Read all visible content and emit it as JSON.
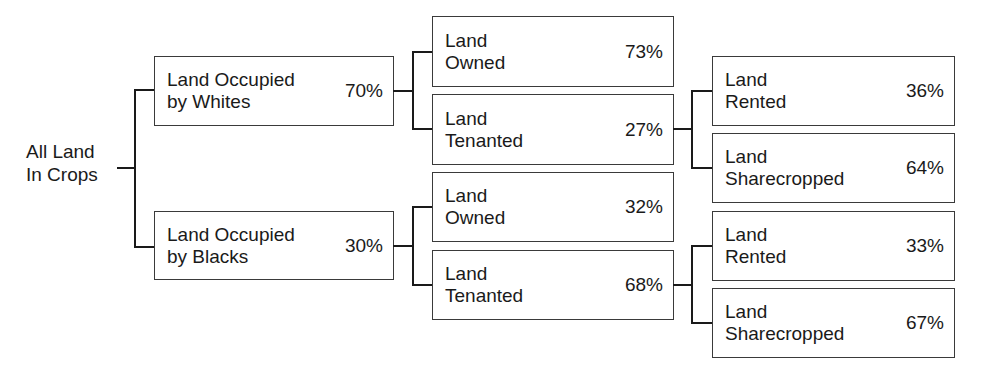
{
  "root": {
    "label": "All Land\nIn Crops"
  },
  "level1": [
    {
      "label": "Land Occupied\nby Whites",
      "percent": "70%"
    },
    {
      "label": "Land Occupied\nby Blacks",
      "percent": "30%"
    }
  ],
  "level2": [
    {
      "label": "Land\nOwned",
      "percent": "73%"
    },
    {
      "label": "Land\nTenanted",
      "percent": "27%"
    },
    {
      "label": "Land\nOwned",
      "percent": "32%"
    },
    {
      "label": "Land\nTenanted",
      "percent": "68%"
    }
  ],
  "level3": [
    {
      "label": "Land\nRented",
      "percent": "36%"
    },
    {
      "label": "Land\nSharecropped",
      "percent": "64%"
    },
    {
      "label": "Land\nRented",
      "percent": "33%"
    },
    {
      "label": "Land\nSharecropped",
      "percent": "67%"
    }
  ]
}
